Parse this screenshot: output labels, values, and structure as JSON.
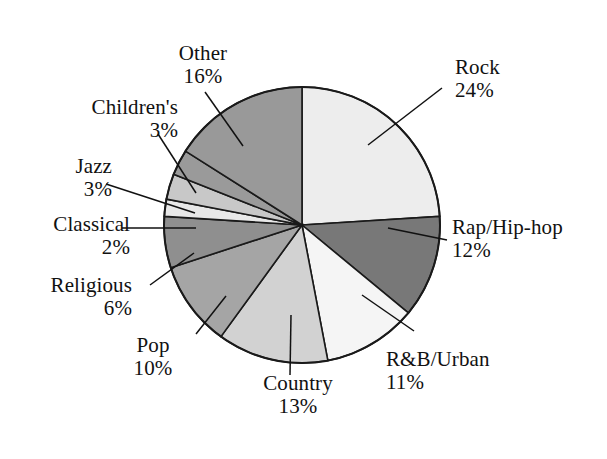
{
  "chart_data": {
    "type": "pie",
    "title": "",
    "subtitle": "",
    "xlabel": "",
    "ylabel": "",
    "legend_position": "none",
    "grid": false,
    "labels_show_percent": true,
    "total_percent": 100,
    "categories": [
      "Rock",
      "Rap/Hip-hop",
      "R&B/Urban",
      "Country",
      "Pop",
      "Religious",
      "Classical",
      "Jazz",
      "Children's",
      "Other"
    ],
    "values": [
      24,
      12,
      11,
      13,
      10,
      6,
      2,
      3,
      3,
      16
    ],
    "slices": [
      {
        "label": "Rock",
        "percent": 24,
        "percent_text": "24%",
        "color": "#ededed",
        "start_angle": 0,
        "end_angle": 86.4
      },
      {
        "label": "Rap/Hip-hop",
        "percent": 12,
        "percent_text": "12%",
        "color": "#787878",
        "start_angle": 86.4,
        "end_angle": 129.6
      },
      {
        "label": "R&B/Urban",
        "percent": 11,
        "percent_text": "11%",
        "color": "#f5f5f5",
        "start_angle": 129.6,
        "end_angle": 169.2
      },
      {
        "label": "Country",
        "percent": 13,
        "percent_text": "13%",
        "color": "#d2d2d2",
        "start_angle": 169.2,
        "end_angle": 216.0
      },
      {
        "label": "Pop",
        "percent": 10,
        "percent_text": "10%",
        "color": "#a5a5a5",
        "start_angle": 216.0,
        "end_angle": 252.0
      },
      {
        "label": "Religious",
        "percent": 6,
        "percent_text": "6%",
        "color": "#8f8f8f",
        "start_angle": 252.0,
        "end_angle": 273.6
      },
      {
        "label": "Classical",
        "percent": 2,
        "percent_text": "2%",
        "color": "#e8e8e8",
        "start_angle": 273.6,
        "end_angle": 280.8
      },
      {
        "label": "Jazz",
        "percent": 3,
        "percent_text": "3%",
        "color": "#c8c8c8",
        "start_angle": 280.8,
        "end_angle": 291.6
      },
      {
        "label": "Children's",
        "percent": 3,
        "percent_text": "3%",
        "color": "#9a9a9a",
        "start_angle": 291.6,
        "end_angle": 302.4
      },
      {
        "label": "Other",
        "percent": 16,
        "percent_text": "16%",
        "color": "#999999",
        "start_angle": 302.4,
        "end_angle": 360.0
      }
    ],
    "geometry": {
      "center_x": 302,
      "center_y": 225,
      "radius": 138,
      "start_angle_offset_deg": -90,
      "direction": "clockwise"
    },
    "style": {
      "background": "#ffffff",
      "slice_border": "#1a1a1a",
      "text_color": "#111111",
      "leader_line_color": "#111111"
    }
  },
  "labels": {
    "rock": {
      "name": "Rock",
      "percent": "24%"
    },
    "rap": {
      "name": "Rap/Hip-hop",
      "percent": "12%"
    },
    "rnb": {
      "name": "R&B/Urban",
      "percent": "11%"
    },
    "country": {
      "name": "Country",
      "percent": "13%"
    },
    "pop": {
      "name": "Pop",
      "percent": "10%"
    },
    "religious": {
      "name": "Religious",
      "percent": "6%"
    },
    "classical": {
      "name": "Classical",
      "percent": "2%"
    },
    "jazz": {
      "name": "Jazz",
      "percent": "3%"
    },
    "childrens": {
      "name": "Children's",
      "percent": "3%"
    },
    "other": {
      "name": "Other",
      "percent": "16%"
    }
  },
  "leader_lines": [
    {
      "for": "rock",
      "x1": 442,
      "y1": 88,
      "x2": 368,
      "y2": 145
    },
    {
      "for": "rap",
      "x1": 447,
      "y1": 240,
      "x2": 388,
      "y2": 228
    },
    {
      "for": "rnb",
      "x1": 414,
      "y1": 331,
      "x2": 362,
      "y2": 295
    },
    {
      "for": "country",
      "x1": 290,
      "y1": 375,
      "x2": 291,
      "y2": 315
    },
    {
      "for": "pop",
      "x1": 196,
      "y1": 334,
      "x2": 226,
      "y2": 296
    },
    {
      "for": "religious",
      "x1": 150,
      "y1": 285,
      "x2": 194,
      "y2": 253
    },
    {
      "for": "classical",
      "x1": 122,
      "y1": 228,
      "x2": 196,
      "y2": 228
    },
    {
      "for": "jazz",
      "x1": 106,
      "y1": 184,
      "x2": 195,
      "y2": 213
    },
    {
      "for": "childrens",
      "x1": 158,
      "y1": 134,
      "x2": 196,
      "y2": 193
    },
    {
      "for": "other",
      "x1": 205,
      "y1": 92,
      "x2": 243,
      "y2": 146
    }
  ]
}
